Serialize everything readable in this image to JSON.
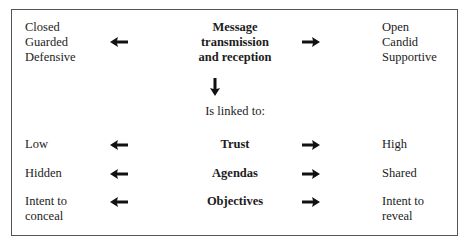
{
  "diagram": {
    "top": {
      "left_lines": [
        "Closed",
        "Guarded",
        "Defensive"
      ],
      "center_lines": [
        "Message",
        "transmission",
        "and reception"
      ],
      "right_lines": [
        "Open",
        "Candid",
        "Supportive"
      ]
    },
    "linked_label": "Is linked to:",
    "rows": [
      {
        "left": [
          "Low"
        ],
        "center": "Trust",
        "right": [
          "High"
        ]
      },
      {
        "left": [
          "Hidden"
        ],
        "center": "Agendas",
        "right": [
          "Shared"
        ]
      },
      {
        "left": [
          "Intent to",
          "conceal"
        ],
        "center": "Objectives",
        "right": [
          "Intent to",
          "reveal"
        ]
      }
    ],
    "icons": {
      "left_arrow": "arrow-left-icon",
      "right_arrow": "arrow-right-icon",
      "down_arrow": "arrow-down-icon"
    },
    "colors": {
      "text": "#1c1c1c",
      "border": "#555555",
      "arrow": "#111111"
    }
  }
}
